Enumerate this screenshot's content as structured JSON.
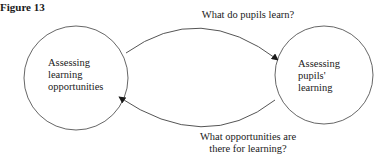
{
  "figure": {
    "title": "Figure 13"
  },
  "nodes": [
    {
      "id": "left",
      "label": "Assessing\nlearning\nopportunities",
      "cx": 76,
      "cy": 78,
      "r": 52
    },
    {
      "id": "right",
      "label": "Assessing\npupils'\nlearning",
      "cx": 324,
      "cy": 75,
      "r": 49
    }
  ],
  "edges": [
    {
      "from": "left",
      "to": "right",
      "label": "What do pupils learn?",
      "position": "top"
    },
    {
      "from": "right",
      "to": "left",
      "label": "What opportunities are\nthere for learning?",
      "position": "bottom"
    }
  ],
  "colors": {
    "stroke": "#555555",
    "arrowhead": "#1a1a1a",
    "text": "#1a1a1a",
    "background": "#ffffff"
  }
}
